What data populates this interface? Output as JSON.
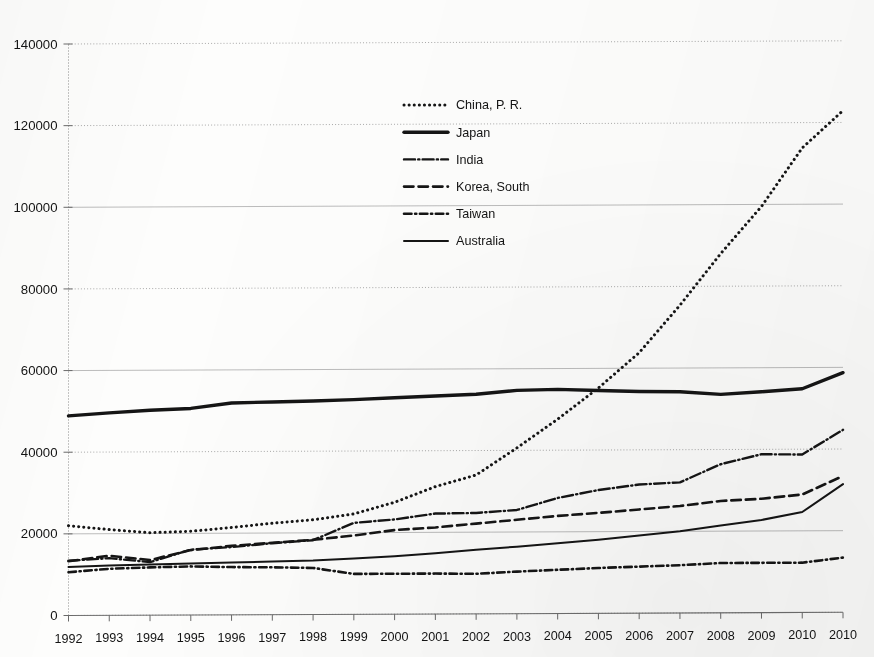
{
  "chart_data": {
    "type": "line",
    "title": "",
    "subtitle": "",
    "xlabel": "",
    "ylabel": "",
    "xlim": [
      0,
      19
    ],
    "ylim": [
      0,
      140000
    ],
    "grid": true,
    "legend_position": "inside-upper-left",
    "x": [
      "1992",
      "1993",
      "1994",
      "1995",
      "1996",
      "1997",
      "1998",
      "1999",
      "2000",
      "2001",
      "2002",
      "2003",
      "2004",
      "2005",
      "2006",
      "2007",
      "2008",
      "2009",
      "2010",
      "2010"
    ],
    "xtick_labels": [
      "1992",
      "1993",
      "1994",
      "1995",
      "1996",
      "1997",
      "1998",
      "1999",
      "2000",
      "2001",
      "2002",
      "2003",
      "2004",
      "2005",
      "2006",
      "2007",
      "2008",
      "2009",
      "2010",
      "2010"
    ],
    "ytick_labels": [
      "0",
      "20000",
      "40000",
      "60000",
      "80000",
      "100000",
      "120000",
      "140000"
    ],
    "ytick_values": [
      0,
      20000,
      40000,
      60000,
      80000,
      100000,
      120000,
      140000
    ],
    "series": [
      {
        "name": "China, P. R.",
        "style": "dotted",
        "stroke_width": 3.0,
        "dasharray": "0.1 5.0",
        "values": [
          22000,
          21000,
          20200,
          20500,
          21400,
          22400,
          23200,
          24600,
          27400,
          31200,
          34000,
          40600,
          47600,
          55200,
          63800,
          75400,
          88000,
          99500,
          113800,
          122900
        ]
      },
      {
        "name": "Japan",
        "style": "solid",
        "stroke_width": 3.4,
        "dasharray": "none",
        "values": [
          48900,
          49600,
          50200,
          50600,
          51900,
          52100,
          52300,
          52600,
          53000,
          53400,
          53800,
          54700,
          54900,
          54600,
          54300,
          54200,
          53500,
          54100,
          54800,
          58700
        ]
      },
      {
        "name": "India",
        "style": "dash-dot",
        "stroke_width": 2.4,
        "dasharray": "11 3.2 1.2 3.2",
        "values": [
          13400,
          14000,
          13000,
          16000,
          16600,
          17500,
          18200,
          22400,
          23200,
          24600,
          24700,
          25400,
          28300,
          30200,
          31500,
          32000,
          36400,
          38800,
          38700,
          44700
        ]
      },
      {
        "name": "Korea, South",
        "style": "dashed",
        "stroke_width": 2.6,
        "dasharray": "9.5 5.0",
        "values": [
          13300,
          14600,
          13500,
          15900,
          16900,
          17600,
          18300,
          19300,
          20600,
          21200,
          22100,
          23000,
          23900,
          24600,
          25400,
          26200,
          27400,
          27900,
          28900,
          33400
        ]
      },
      {
        "name": "Taiwan",
        "style": "dash-dot-small",
        "stroke_width": 2.6,
        "dasharray": "7.5 3.6 1.2 3.6",
        "values": [
          10600,
          11400,
          11700,
          11900,
          11700,
          11600,
          11400,
          9900,
          9900,
          9900,
          9800,
          10300,
          10700,
          11100,
          11400,
          11700,
          12200,
          12200,
          12200,
          13400
        ]
      },
      {
        "name": "Australia",
        "style": "solid-thin",
        "stroke_width": 2.0,
        "dasharray": "none",
        "values": [
          11900,
          12200,
          12400,
          12600,
          12800,
          13000,
          13200,
          13700,
          14200,
          14900,
          15700,
          16400,
          17200,
          18000,
          19000,
          20000,
          21400,
          22700,
          24600,
          31400
        ]
      }
    ]
  },
  "legend": {
    "items": [
      {
        "label": "China, P. R."
      },
      {
        "label": "Japan"
      },
      {
        "label": "India"
      },
      {
        "label": "Korea, South"
      },
      {
        "label": "Taiwan"
      },
      {
        "label": "Australia"
      }
    ]
  },
  "colors": {
    "ink": "#151515",
    "gridline": "#9a9a9a",
    "gridline_major": "#b4b4b4",
    "axis": "#6f6f6f",
    "paper": "#fdfdfc"
  }
}
